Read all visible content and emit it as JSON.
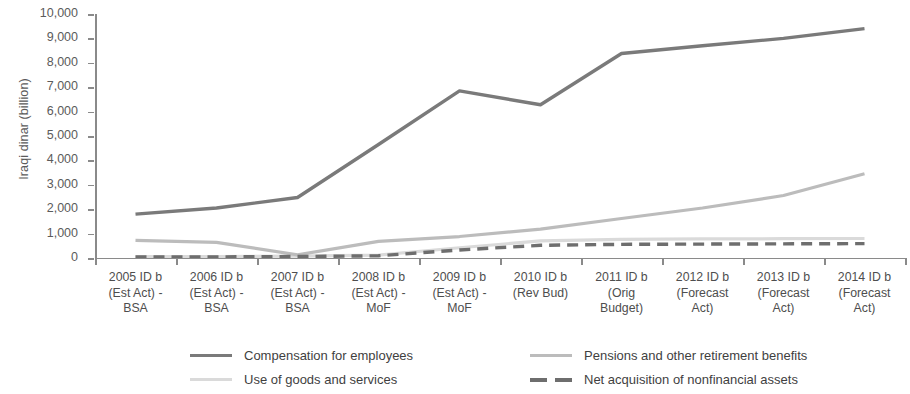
{
  "axis": {
    "y_title": "Iraqi dinar (billion)",
    "y_ticks": [
      "10,000",
      "9,000",
      "8,000",
      "7,000",
      "6,000",
      "5,000",
      "4,000",
      "3,000",
      "2,000",
      "1,000",
      "0"
    ]
  },
  "categories_display": [
    [
      "2005  ID b",
      "(Est Act) -",
      "BSA"
    ],
    [
      "2006  ID b",
      "(Est Act) -",
      "BSA"
    ],
    [
      "2007  ID b",
      "(Est Act) -",
      "BSA"
    ],
    [
      "2008  ID b",
      "(Est Act) -",
      "MoF"
    ],
    [
      "2009  ID b",
      "(Est Act) -",
      "MoF"
    ],
    [
      "2010 ID b",
      "(Rev Bud)",
      ""
    ],
    [
      "2011  ID b",
      "(Orig",
      "Budget)"
    ],
    [
      "2012  ID b",
      "(Forecast",
      "Act)"
    ],
    [
      "2013  ID b",
      "(Forecast",
      "Act)"
    ],
    [
      "2014  ID b",
      "(Forecast",
      "Act)"
    ]
  ],
  "legend": {
    "items": [
      {
        "label": "Compensation for employees",
        "color": "#7a7a7a",
        "style": "solid"
      },
      {
        "label": "Pensions and other retirement benefits",
        "color": "#bcbcbc",
        "style": "solid"
      },
      {
        "label": "Use of goods and services",
        "color": "#dadada",
        "style": "solid"
      },
      {
        "label": "Net acquisition of nonfinancial assets",
        "color": "#6e6e6e",
        "style": "dashed"
      }
    ]
  },
  "chart_data": {
    "type": "line",
    "title": "",
    "xlabel": "",
    "ylabel": "Iraqi dinar (billion)",
    "ylim": [
      0,
      10000
    ],
    "ytick_step": 1000,
    "grid": false,
    "legend_position": "bottom",
    "categories": [
      "2005 ID b (Est Act) - BSA",
      "2006 ID b (Est Act) - BSA",
      "2007 ID b (Est Act) - BSA",
      "2008 ID b (Est Act) - MoF",
      "2009 ID b (Est Act) - MoF",
      "2010 ID b (Rev Bud)",
      "2011 ID b (Orig Budget)",
      "2012 ID b (Forecast Act)",
      "2013 ID b (Forecast Act)",
      "2014 ID b (Forecast Act)"
    ],
    "series": [
      {
        "name": "Compensation for employees",
        "color": "#7a7a7a",
        "style": "solid",
        "width": 3.4,
        "values": [
          1800,
          2050,
          2480,
          4650,
          6850,
          6280,
          8380,
          8700,
          9000,
          9400
        ]
      },
      {
        "name": "Pensions and other retirement benefits",
        "color": "#bcbcbc",
        "style": "solid",
        "width": 3.2,
        "values": [
          720,
          640,
          130,
          680,
          880,
          1180,
          1620,
          2050,
          2560,
          3450
        ]
      },
      {
        "name": "Use of goods and services",
        "color": "#dadada",
        "style": "solid",
        "width": 3.2,
        "values": [
          60,
          60,
          80,
          120,
          420,
          700,
          760,
          780,
          790,
          800
        ]
      },
      {
        "name": "Net acquisition of nonfinancial assets",
        "color": "#6e6e6e",
        "style": "dashed",
        "width": 3.4,
        "values": [
          40,
          45,
          60,
          90,
          330,
          520,
          560,
          570,
          580,
          590
        ]
      }
    ]
  }
}
